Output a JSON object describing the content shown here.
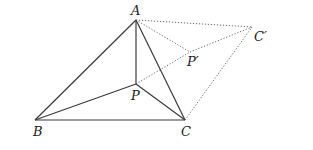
{
  "diagram": {
    "type": "geometry",
    "points": {
      "A": {
        "label": "A",
        "x": 136,
        "y": 20,
        "label_x": 131,
        "label_y": 15
      },
      "B": {
        "label": "B",
        "x": 35,
        "y": 120,
        "label_x": 33,
        "label_y": 136
      },
      "C": {
        "label": "C",
        "x": 185,
        "y": 120,
        "label_x": 181,
        "label_y": 136
      },
      "P": {
        "label": "P",
        "x": 136,
        "y": 84,
        "label_x": 131,
        "label_y": 100
      },
      "P_prime": {
        "label": "P′",
        "x": 190,
        "y": 52,
        "label_x": 187,
        "label_y": 66
      },
      "C_prime": {
        "label": "C′",
        "x": 252,
        "y": 27,
        "label_x": 254,
        "label_y": 41
      }
    },
    "solid_segments": [
      [
        "A",
        "B"
      ],
      [
        "A",
        "C"
      ],
      [
        "B",
        "C"
      ],
      [
        "A",
        "P"
      ],
      [
        "B",
        "P"
      ],
      [
        "C",
        "P"
      ]
    ],
    "dotted_segments": [
      [
        "A",
        "C_prime"
      ],
      [
        "A",
        "P_prime"
      ],
      [
        "P",
        "P_prime"
      ],
      [
        "P_prime",
        "C_prime"
      ],
      [
        "C",
        "C_prime"
      ]
    ]
  }
}
